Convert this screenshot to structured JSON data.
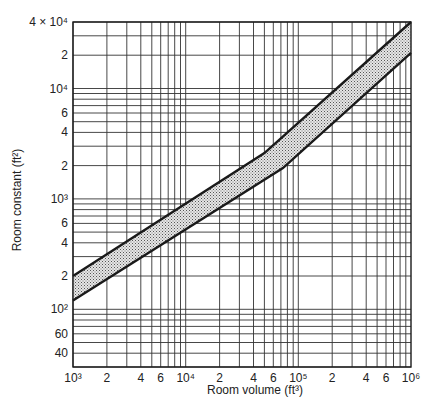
{
  "chart_data": {
    "type": "area",
    "title": "",
    "xlabel": "Room volume (ft³)",
    "ylabel": "Room constant (ft²)",
    "xscale": "log",
    "yscale": "log",
    "xlim": [
      1000,
      1000000
    ],
    "ylim": [
      30,
      40000
    ],
    "grid": true,
    "legend": null,
    "x_tick_labels": [
      {
        "value": 1000,
        "label": "10³"
      },
      {
        "value": 2000,
        "label": "2"
      },
      {
        "value": 4000,
        "label": "4"
      },
      {
        "value": 6000,
        "label": "6"
      },
      {
        "value": 10000,
        "label": "10⁴"
      },
      {
        "value": 20000,
        "label": "2"
      },
      {
        "value": 40000,
        "label": "4"
      },
      {
        "value": 60000,
        "label": "6"
      },
      {
        "value": 100000,
        "label": "10⁵"
      },
      {
        "value": 200000,
        "label": "2"
      },
      {
        "value": 400000,
        "label": "4"
      },
      {
        "value": 600000,
        "label": "6"
      },
      {
        "value": 1000000,
        "label": "10⁶"
      }
    ],
    "y_tick_labels": [
      {
        "value": 40,
        "label": "40"
      },
      {
        "value": 60,
        "label": "60"
      },
      {
        "value": 100,
        "label": "10²"
      },
      {
        "value": 200,
        "label": "2"
      },
      {
        "value": 400,
        "label": "4"
      },
      {
        "value": 600,
        "label": "6"
      },
      {
        "value": 1000,
        "label": "10³"
      },
      {
        "value": 2000,
        "label": "2"
      },
      {
        "value": 4000,
        "label": "4"
      },
      {
        "value": 6000,
        "label": "6"
      },
      {
        "value": 10000,
        "label": "10⁴"
      },
      {
        "value": 20000,
        "label": "2"
      },
      {
        "value": 40000,
        "label": "4 × 10⁴"
      }
    ],
    "series": [
      {
        "name": "upper bound",
        "x": [
          1000,
          50000,
          1000000
        ],
        "y": [
          200,
          2600,
          40000
        ]
      },
      {
        "name": "lower bound",
        "x": [
          1000,
          73000,
          1000000
        ],
        "y": [
          120,
          1900,
          21000
        ]
      }
    ],
    "band": {
      "between": [
        "upper bound",
        "lower bound"
      ],
      "fill": "stippled"
    }
  },
  "colors": {
    "line": "#1a1a1a",
    "grid": "#333333",
    "band_fill": "#9a9a9a",
    "background": "#ffffff"
  }
}
